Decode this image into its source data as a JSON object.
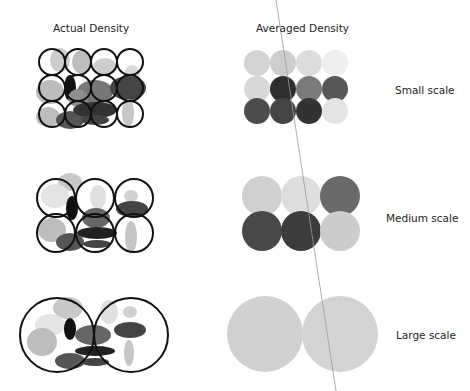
{
  "headers": {
    "actual": "Actual Density",
    "averaged": "Averaged Density"
  },
  "rows": [
    {
      "label": "Small scale",
      "grid": "4x3"
    },
    {
      "label": "Medium scale",
      "grid": "3x2"
    },
    {
      "label": "Large scale",
      "grid": "2x1"
    }
  ],
  "averaged_colors": {
    "small": [
      [
        "#d3d3d3",
        "#cdcdcd",
        "#dcdcdc",
        "#eeeeee"
      ],
      [
        "#d8d8d8",
        "#2e2e2e",
        "#7a7a7a",
        "#585858"
      ],
      [
        "#4c4c4c",
        "#444444",
        "#333333",
        "#e4e4e4"
      ]
    ],
    "medium": [
      [
        "#cfcfcf",
        "#dedede",
        "#6a6a6a"
      ],
      [
        "#484848",
        "#3c3c3c",
        "#cccccc"
      ]
    ],
    "large": [
      [
        "#d0d0d0",
        "#d3d3d3"
      ]
    ]
  }
}
